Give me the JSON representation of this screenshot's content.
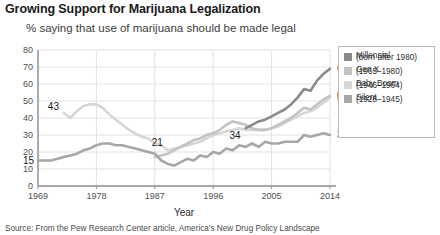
{
  "chart_data": {
    "type": "line",
    "title": "Growing Support for Marijuana Legalization",
    "subtitle": "% saying that use of marijuana should be made legal",
    "xlabel": "Year",
    "ylabel": "",
    "xlim": [
      1969,
      2014
    ],
    "ylim": [
      0,
      80
    ],
    "xticks": [
      "1969",
      "1978",
      "1987",
      "1996",
      "2005",
      "2014"
    ],
    "xtick_values": [
      1969,
      1978,
      1987,
      1996,
      2005,
      2014
    ],
    "yticks": [
      "0",
      "10",
      "20",
      "30",
      "40",
      "50",
      "60",
      "70",
      "80"
    ],
    "ytick_values": [
      0,
      10,
      20,
      30,
      40,
      50,
      60,
      70,
      80
    ],
    "grid": true,
    "legend_position": "right",
    "series": [
      {
        "name": "Millennial",
        "sub": "(born after 1980)",
        "color": "#8a8a8a",
        "x": [
          2001,
          2002,
          2003,
          2004,
          2005,
          2006,
          2007,
          2008,
          2009,
          2010,
          2011,
          2012,
          2013,
          2014
        ],
        "values": [
          34,
          36,
          38,
          39,
          41,
          43,
          45,
          48,
          52,
          57,
          56,
          62,
          66,
          69
        ]
      },
      {
        "name": "Gen X",
        "sub": "(1965–1980)",
        "color": "#c3c3c3",
        "x": [
          1987,
          1989,
          1990,
          1991,
          1992,
          1993,
          1994,
          1995,
          1996,
          1997,
          1998,
          1999,
          2000,
          2001,
          2002,
          2003,
          2004,
          2005,
          2006,
          2007,
          2008,
          2009,
          2010,
          2011,
          2012,
          2013,
          2014
        ],
        "values": [
          17,
          19,
          21,
          23,
          25,
          27,
          28,
          30,
          31,
          33,
          36,
          38,
          37,
          36,
          34,
          33,
          33,
          34,
          36,
          38,
          40,
          43,
          46,
          45,
          48,
          51,
          53
        ]
      },
      {
        "name": "Baby Boom",
        "sub": "(1946–1964)",
        "color": "#d6d6d6",
        "x": [
          1973,
          1974,
          1975,
          1976,
          1977,
          1978,
          1979,
          1980,
          1981,
          1982,
          1983,
          1984,
          1985,
          1986,
          1987,
          1988,
          1989,
          1990,
          1991,
          1992,
          1993,
          1994,
          1995,
          1996,
          1997,
          1998,
          1999,
          2000,
          2001,
          2002,
          2003,
          2004,
          2005,
          2006,
          2007,
          2008,
          2009,
          2010,
          2011,
          2012,
          2013,
          2014
        ],
        "values": [
          43,
          40,
          44,
          47,
          48,
          48,
          46,
          42,
          39,
          36,
          33,
          31,
          29,
          28,
          25,
          24,
          21,
          22,
          23,
          24,
          25,
          26,
          28,
          30,
          31,
          32,
          33,
          34,
          33,
          33,
          33,
          33,
          34,
          35,
          37,
          39,
          41,
          43,
          44,
          46,
          49,
          52
        ]
      },
      {
        "name": "Silent",
        "sub": "(1928–1945)",
        "color": "#a6a6a6",
        "x": [
          1969,
          1971,
          1972,
          1973,
          1974,
          1975,
          1976,
          1977,
          1978,
          1979,
          1980,
          1981,
          1982,
          1983,
          1984,
          1985,
          1986,
          1987,
          1988,
          1989,
          1990,
          1991,
          1992,
          1993,
          1994,
          1995,
          1996,
          1997,
          1998,
          1999,
          2000,
          2001,
          2002,
          2003,
          2004,
          2005,
          2006,
          2007,
          2008,
          2009,
          2010,
          2011,
          2012,
          2013,
          2014
        ],
        "values": [
          15,
          15,
          16,
          17,
          18,
          19,
          21,
          22,
          24,
          25,
          25,
          24,
          24,
          23,
          22,
          21,
          20,
          19,
          15,
          13,
          12,
          14,
          16,
          15,
          18,
          17,
          20,
          19,
          22,
          21,
          24,
          23,
          25,
          23,
          26,
          25,
          25,
          26,
          26,
          26,
          30,
          29,
          30,
          31,
          30
        ]
      }
    ],
    "point_labels": [
      {
        "text": "15",
        "series": "Silent",
        "x": 1969,
        "value": 15
      },
      {
        "text": "43",
        "series": "Baby Boom",
        "x": 1973,
        "value": 43
      },
      {
        "text": "21",
        "series": "Baby Boom",
        "x": 1989,
        "value": 21
      },
      {
        "text": "34",
        "series": "Millennial",
        "x": 2001,
        "value": 34
      },
      {
        "text": "69",
        "series": "Millennial",
        "x": 2014,
        "value": 69
      },
      {
        "text": "53",
        "series": "Gen X",
        "x": 2014,
        "value": 53
      },
      {
        "text": "52",
        "series": "Baby Boom",
        "x": 2014,
        "value": 52
      },
      {
        "text": "30",
        "series": "Silent",
        "x": 2014,
        "value": 30
      }
    ],
    "source": "Source: From the Pew Research Center article, America's New Drug Policy Landscape"
  }
}
